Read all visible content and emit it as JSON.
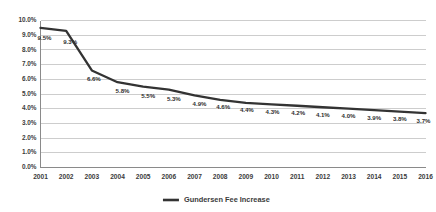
{
  "chart_data": {
    "type": "line",
    "title": "",
    "xlabel": "",
    "ylabel": "",
    "categories": [
      "2001",
      "2002",
      "2003",
      "2004",
      "2005",
      "2006",
      "2007",
      "2008",
      "2009",
      "2010",
      "2011",
      "2012",
      "2013",
      "2014",
      "2015",
      "2016"
    ],
    "values": [
      9.5,
      9.3,
      6.6,
      5.8,
      5.5,
      5.3,
      4.9,
      4.6,
      4.4,
      4.3,
      4.2,
      4.1,
      4.0,
      3.9,
      3.8,
      3.7
    ],
    "point_labels": [
      "9.5%",
      "9.3%",
      "6.6%",
      "5.8%",
      "5.5%",
      "5.3%",
      "4.9%",
      "4.6%",
      "4.4%",
      "4.3%",
      "4.2%",
      "4.1%",
      "4.0%",
      "3.9%",
      "3.8%",
      "3.7%"
    ],
    "ylim": [
      0,
      10
    ],
    "ytick_values": [
      0,
      1,
      2,
      3,
      4,
      5,
      6,
      7,
      8,
      9,
      10
    ],
    "ytick_labels": [
      "0.0%",
      "1.0%",
      "2.0%",
      "3.0%",
      "4.0%",
      "5.0%",
      "6.0%",
      "7.0%",
      "8.0%",
      "9.0%",
      "10.0%"
    ],
    "grid": true,
    "legend_position": "bottom-center",
    "series": [
      {
        "name": "Gundersen Fee Increase",
        "color": "#333333",
        "values": [
          9.5,
          9.3,
          6.6,
          5.8,
          5.5,
          5.3,
          4.9,
          4.6,
          4.4,
          4.3,
          4.2,
          4.1,
          4.0,
          3.9,
          3.8,
          3.7
        ]
      }
    ]
  },
  "legend": {
    "entries": [
      {
        "label": "Gundersen Fee Increase"
      }
    ]
  },
  "colors": {
    "series": "#333333",
    "gridline": "#c8c8c8",
    "axis": "#8a8a8a",
    "text": "#3b3b3b",
    "background": "#ffffff"
  }
}
